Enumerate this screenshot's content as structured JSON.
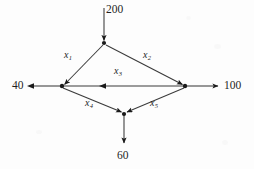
{
  "diagram": {
    "type": "directed-flow-network",
    "canvas": {
      "width": 254,
      "height": 169
    },
    "colors": {
      "background": "#fdfdfd",
      "stroke": "#3a3a3a",
      "node": "#1a1a1a",
      "text": "#1f1f1f"
    },
    "nodes": [
      {
        "id": "top",
        "label": "",
        "x": 104,
        "y": 43
      },
      {
        "id": "left",
        "label": "",
        "x": 62,
        "y": 86
      },
      {
        "id": "right",
        "label": "",
        "x": 185,
        "y": 86
      },
      {
        "id": "bottom",
        "label": "",
        "x": 124,
        "y": 114
      }
    ],
    "external_flows": [
      {
        "name": "supply-200",
        "value": "200",
        "direction": "into-top",
        "arrow": "down"
      },
      {
        "name": "demand-40",
        "value": "40",
        "direction": "out-of-left",
        "arrow": "left"
      },
      {
        "name": "demand-100",
        "value": "100",
        "direction": "out-of-right",
        "arrow": "right"
      },
      {
        "name": "demand-60",
        "value": "60",
        "direction": "out-of-bottom",
        "arrow": "down"
      }
    ],
    "edges": [
      {
        "name": "edge-x1",
        "var": "x",
        "sub": "1",
        "from": "top",
        "to": "left",
        "arrow": "left"
      },
      {
        "name": "edge-x2",
        "var": "x",
        "sub": "2",
        "from": "top",
        "to": "right",
        "arrow": "right"
      },
      {
        "name": "edge-x3",
        "var": "x",
        "sub": "3",
        "from": "right",
        "to": "left",
        "arrow": "left"
      },
      {
        "name": "edge-x4",
        "var": "x",
        "sub": "4",
        "from": "left",
        "to": "bottom",
        "arrow": "right"
      },
      {
        "name": "edge-x5",
        "var": "x",
        "sub": "5",
        "from": "right",
        "to": "bottom",
        "arrow": "left"
      }
    ]
  },
  "labels": {
    "supply_200": "200",
    "demand_40": "40",
    "demand_100": "100",
    "demand_60": "60",
    "x1": "x",
    "x1_sub": "1",
    "x2": "x",
    "x2_sub": "2",
    "x3": "x",
    "x3_sub": "3",
    "x4": "x",
    "x4_sub": "4",
    "x5": "x",
    "x5_sub": "5"
  }
}
